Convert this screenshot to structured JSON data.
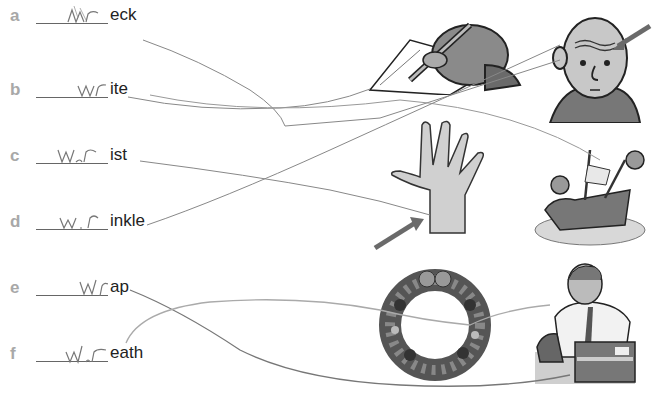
{
  "worksheet": {
    "items": [
      {
        "letter": "a",
        "handwritten": "wr",
        "ending": "eck",
        "word": "wreck"
      },
      {
        "letter": "b",
        "handwritten": "wr",
        "ending": "ite",
        "word": "write"
      },
      {
        "letter": "c",
        "handwritten": "wr",
        "ending": "ist",
        "word": "wrist"
      },
      {
        "letter": "d",
        "handwritten": "wr",
        "ending": "inkle",
        "word": "wrinkle"
      },
      {
        "letter": "e",
        "handwritten": "wr",
        "ending": "ap",
        "word": "wrap"
      },
      {
        "letter": "f",
        "handwritten": "wr",
        "ending": "eath",
        "word": "wreath"
      }
    ],
    "pictures": [
      {
        "name": "hand-writing-picture",
        "depicts": "hand writing with pen"
      },
      {
        "name": "old-man-wrinkles-picture",
        "depicts": "old man with wrinkled forehead, arrow pointing"
      },
      {
        "name": "hand-wrist-picture",
        "depicts": "open hand with arrow pointing to wrist"
      },
      {
        "name": "shipwreck-picture",
        "depicts": "wrecked ship with sea creatures"
      },
      {
        "name": "wreath-picture",
        "depicts": "christmas wreath"
      },
      {
        "name": "man-wrapping-picture",
        "depicts": "man wrapping a box with tape"
      }
    ],
    "matches": [
      {
        "from": "a",
        "to": "hand-wrist-picture"
      },
      {
        "from": "b",
        "to": "hand-writing-picture"
      },
      {
        "from": "c",
        "to": "hand-wrist-picture"
      },
      {
        "from": "d",
        "to": "old-man-wrinkles-picture"
      },
      {
        "from": "e",
        "to": "man-wrapping-picture"
      },
      {
        "from": "f",
        "to": "wreath-picture"
      }
    ]
  }
}
